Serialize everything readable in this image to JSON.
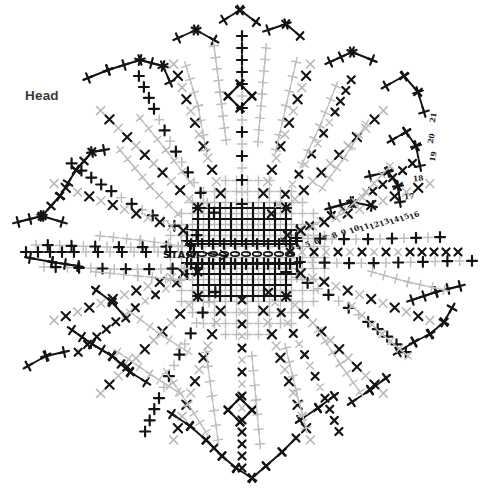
{
  "document": {
    "type": "embroidery-stitch-pattern-diagram",
    "title": "Head",
    "background_color": "#ffffff"
  },
  "labels": {
    "head": "Head",
    "start": "START"
  },
  "colors": {
    "stitch_dark": "#141414",
    "stitch_light": "#b7b7b7",
    "stitch_mid": "#6e6e6e",
    "ink": "#1a1a1a",
    "paper": "#ffffff",
    "label_text": "#3a3a3a"
  },
  "stitch_order_numbers": [
    {
      "value": "1",
      "x": 280,
      "y": 236,
      "rot": -24
    },
    {
      "value": "2",
      "x": 288,
      "y": 232,
      "rot": -24
    },
    {
      "value": "3",
      "x": 289,
      "y": 243,
      "rot": -24
    },
    {
      "value": "4",
      "x": 296,
      "y": 243,
      "rot": -24
    },
    {
      "value": "5",
      "x": 305,
      "y": 240,
      "rot": -24
    },
    {
      "value": "6",
      "x": 314,
      "y": 237,
      "rot": -24
    },
    {
      "value": "7",
      "x": 323,
      "y": 234,
      "rot": -24
    },
    {
      "value": "8",
      "x": 332,
      "y": 231,
      "rot": -24
    },
    {
      "value": "9",
      "x": 341,
      "y": 228,
      "rot": -24
    },
    {
      "value": "10",
      "x": 349,
      "y": 225,
      "rot": -24
    },
    {
      "value": "11",
      "x": 359,
      "y": 223,
      "rot": -24
    },
    {
      "value": "12",
      "x": 369,
      "y": 221,
      "rot": -24
    },
    {
      "value": "13",
      "x": 379,
      "y": 218,
      "rot": -24
    },
    {
      "value": "14",
      "x": 389,
      "y": 216,
      "rot": -24
    },
    {
      "value": "15",
      "x": 399,
      "y": 213,
      "rot": -24
    },
    {
      "value": "16",
      "x": 409,
      "y": 211,
      "rot": -24
    },
    {
      "value": "17",
      "x": 404,
      "y": 192,
      "rot": -6
    },
    {
      "value": "18",
      "x": 413,
      "y": 174,
      "rot": -6
    },
    {
      "value": "19",
      "x": 428,
      "y": 152,
      "rot": -80
    },
    {
      "value": "20",
      "x": 426,
      "y": 134,
      "rot": -80
    },
    {
      "value": "21",
      "x": 428,
      "y": 113,
      "rot": -80
    }
  ],
  "legend": {
    "dark_stitch": "bold cross stitch",
    "light_stitch": "light guide cross stitch",
    "chain_stitch": "oval chain stitch"
  },
  "geometry": {
    "center": {
      "x": 242,
      "y": 252
    },
    "arms": 8,
    "note": "radial petal lobes with dense central grid"
  }
}
